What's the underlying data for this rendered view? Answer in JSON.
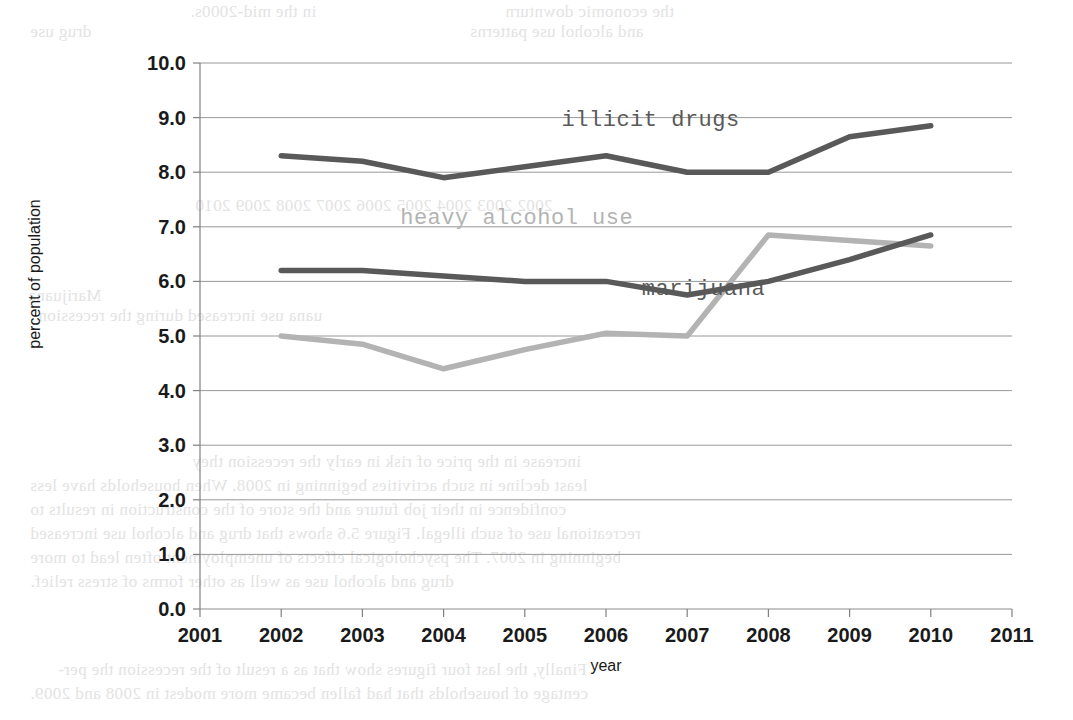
{
  "chart_data": {
    "type": "line",
    "title": "",
    "xlabel": "year",
    "ylabel": "percent of population",
    "xlim": [
      2001,
      2011
    ],
    "ylim": [
      0.0,
      10.0
    ],
    "grid": true,
    "legend_position": "inline-annotations",
    "x_tick_labels": [
      "2001",
      "2002",
      "2003",
      "2004",
      "2005",
      "2006",
      "2007",
      "2008",
      "2009",
      "2010",
      "2011"
    ],
    "y_tick_labels": [
      "0.0",
      "1.0",
      "2.0",
      "3.0",
      "4.0",
      "5.0",
      "6.0",
      "7.0",
      "8.0",
      "9.0",
      "10.0"
    ],
    "x": [
      2002,
      2003,
      2004,
      2005,
      2006,
      2007,
      2008,
      2009,
      2010
    ],
    "series": [
      {
        "name": "illicit drugs",
        "color": "#595959",
        "label_x": 2006.55,
        "label_y": 8.85,
        "values": [
          8.3,
          8.2,
          7.9,
          8.1,
          8.3,
          8.0,
          8.0,
          8.65,
          8.85
        ]
      },
      {
        "name": "heavy alcohol use",
        "color": "#b3b3b3",
        "label_x": 2004.9,
        "label_y": 7.05,
        "values": [
          5.0,
          4.85,
          4.4,
          4.75,
          5.05,
          5.0,
          6.85,
          6.75,
          6.65
        ]
      },
      {
        "name": "marijuana",
        "color": "#595959",
        "label_x": 2007.2,
        "label_y": 5.75,
        "values": [
          6.2,
          6.2,
          6.1,
          6.0,
          6.0,
          5.75,
          6.0,
          6.4,
          6.85
        ]
      }
    ]
  },
  "bleed_through": {
    "lines": [
      {
        "text": "in the     mid-2000s.",
        "x": 190,
        "y": 2
      },
      {
        "text": "the      economic       downturn",
        "x": 505,
        "y": 2
      },
      {
        "text": "drug use",
        "x": 30,
        "y": 22
      },
      {
        "text": "and alcohol   use   patterns",
        "x": 470,
        "y": 22
      },
      {
        "text": "2002 2003 2004 2005 2006 2007 2008 2009 2010",
        "x": 195,
        "y": 196
      },
      {
        "text": "Marijuana",
        "x": 28,
        "y": 286
      },
      {
        "text": "uana use increased during the recession",
        "x": 38,
        "y": 306
      },
      {
        "text": "increase in the price of risk   in   early   the recession they",
        "x": 192,
        "y": 452
      },
      {
        "text": "least decline in such activities  beginning in 2008. When households have less",
        "x": 30,
        "y": 476
      },
      {
        "text": "confidence in their    job   future and the   store of the construction in   results to",
        "x": 30,
        "y": 500
      },
      {
        "text": "recreational use of such illegal.  Figure 5.6 shows that drug  and alcohol  use  increased",
        "x": 30,
        "y": 524
      },
      {
        "text": "beginning in 2007. The psychological effects of unemployment often lead to more",
        "x": 30,
        "y": 548
      },
      {
        "text": "drug and alcohol use as well as other forms of stress relief.",
        "x": 30,
        "y": 572
      },
      {
        "text": "Finally, the last four figures show that as a result of the recession the per-",
        "x": 58,
        "y": 660
      },
      {
        "text": "centage of households that had fallen became more modest in 2008 and 2009.",
        "x": 30,
        "y": 684
      }
    ]
  }
}
